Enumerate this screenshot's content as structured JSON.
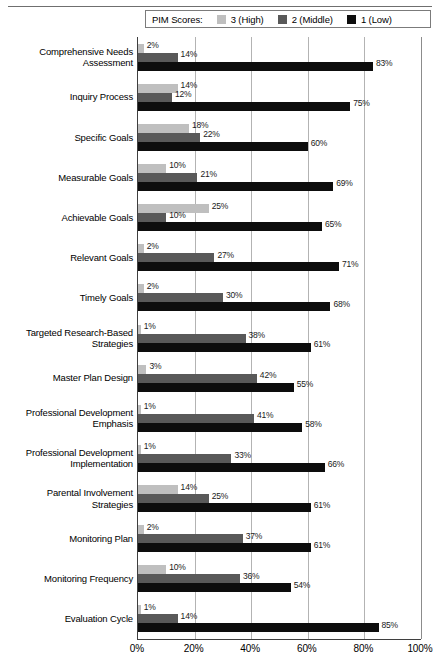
{
  "legend": {
    "title": "PIM Scores:",
    "items": [
      {
        "label": "3 (High)",
        "color": "#bfbfbf",
        "key": "s3"
      },
      {
        "label": "2 (Middle)",
        "color": "#595959",
        "key": "s2"
      },
      {
        "label": "1 (Low)",
        "color": "#0d0d0d",
        "key": "s1"
      }
    ]
  },
  "axis": {
    "x_ticks": [
      "0%",
      "20%",
      "40%",
      "60%",
      "80%",
      "100%"
    ],
    "x_tick_values": [
      0,
      20,
      40,
      60,
      80,
      100
    ]
  },
  "chart_data": {
    "type": "bar",
    "orientation": "horizontal",
    "title": "",
    "xlabel": "",
    "ylabel": "",
    "xlim": [
      0,
      100
    ],
    "grid": true,
    "legend_position": "top",
    "value_suffix": "%",
    "categories": [
      "Comprehensive Needs Assessment",
      "Inquiry Process",
      "Specific Goals",
      "Measurable Goals",
      "Achievable Goals",
      "Relevant Goals",
      "Timely Goals",
      "Targeted Research-Based Strategies",
      "Master Plan Design",
      "Professional Development Emphasis",
      "Professional Development Implementation",
      "Parental Involvement Strategies",
      "Monitoring Plan",
      "Monitoring Frequency",
      "Evaluation Cycle"
    ],
    "category_lines": [
      [
        "Comprehensive Needs",
        "Assessment"
      ],
      [
        "Inquiry Process"
      ],
      [
        "Specific Goals"
      ],
      [
        "Measurable Goals"
      ],
      [
        "Achievable Goals"
      ],
      [
        "Relevant Goals"
      ],
      [
        "Timely Goals"
      ],
      [
        "Targeted Research-Based",
        "Strategies"
      ],
      [
        "Master Plan Design"
      ],
      [
        "Professional Development",
        "Emphasis"
      ],
      [
        "Professional Development",
        "Implementation"
      ],
      [
        "Parental Involvement",
        "Strategies"
      ],
      [
        "Monitoring Plan"
      ],
      [
        "Monitoring Frequency"
      ],
      [
        "Evaluation Cycle"
      ]
    ],
    "series": [
      {
        "name": "3 (High)",
        "color": "#bfbfbf",
        "values": [
          2,
          14,
          18,
          10,
          25,
          2,
          2,
          1,
          3,
          1,
          1,
          14,
          2,
          10,
          1
        ],
        "labels": [
          "2%",
          "14%",
          "18%",
          "10%",
          "25%",
          "2%",
          "2%",
          "1%",
          "3%",
          "1%",
          "1%",
          "14%",
          "2%",
          "10%",
          "1%"
        ]
      },
      {
        "name": "2 (Middle)",
        "color": "#595959",
        "values": [
          14,
          12,
          22,
          21,
          10,
          27,
          30,
          38,
          42,
          41,
          33,
          25,
          37,
          36,
          14
        ],
        "labels": [
          "14%",
          "12%",
          "22%",
          "21%",
          "10%",
          "27%",
          "30%",
          "38%",
          "42%",
          "41%",
          "33%",
          "25%",
          "37%",
          "36%",
          "14%"
        ]
      },
      {
        "name": "1 (Low)",
        "color": "#0d0d0d",
        "values": [
          83,
          75,
          60,
          69,
          65,
          71,
          68,
          61,
          55,
          58,
          66,
          61,
          61,
          54,
          85
        ],
        "labels": [
          "83%",
          "75%",
          "60%",
          "69%",
          "65%",
          "71%",
          "68%",
          "61%",
          "55%",
          "58%",
          "66%",
          "61%",
          "61%",
          "54%",
          "85%"
        ]
      }
    ]
  }
}
